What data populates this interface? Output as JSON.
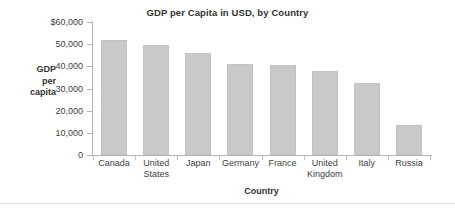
{
  "chart_data": {
    "type": "bar",
    "title": "GDP per Capita in USD, by Country",
    "xlabel": "Country",
    "ylabel": "GDP per capita",
    "ylabel_lines": [
      "GDP",
      "per",
      "capita"
    ],
    "categories": [
      "Canada",
      "United States",
      "Japan",
      "Germany",
      "France",
      "United Kingdom",
      "Italy",
      "Russia"
    ],
    "category_lines": [
      [
        "Canada"
      ],
      [
        "United",
        "States"
      ],
      [
        "Japan"
      ],
      [
        "Germany"
      ],
      [
        "France"
      ],
      [
        "United",
        "Kingdom"
      ],
      [
        "Italy"
      ],
      [
        "Russia"
      ]
    ],
    "values": [
      52000,
      49800,
      46200,
      41200,
      40600,
      38000,
      32500,
      13500
    ],
    "ylim": [
      0,
      60000
    ],
    "ytick_values": [
      60000,
      50000,
      40000,
      30000,
      20000,
      10000,
      0
    ],
    "ytick_labels": [
      "$60,000",
      "50,000",
      "40,000",
      "30,000",
      "20,000",
      "10,000",
      "0"
    ],
    "grid": false,
    "legend": null,
    "bar_color": "#c9c9c9",
    "axis_color": "#b5b5b5",
    "text_color": "#3f3f3f",
    "background": "#ffffff"
  }
}
